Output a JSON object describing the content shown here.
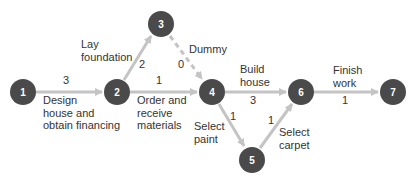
{
  "diagram": {
    "type": "activity-on-arrow network",
    "colors": {
      "node": "#4a4a4a",
      "node_text": "#ffffff",
      "arrow": "#c4c4c4",
      "text": "#333333"
    },
    "nodes": [
      {
        "id": "1",
        "label": "1"
      },
      {
        "id": "2",
        "label": "2"
      },
      {
        "id": "3",
        "label": "3"
      },
      {
        "id": "4",
        "label": "4"
      },
      {
        "id": "5",
        "label": "5"
      },
      {
        "id": "6",
        "label": "6"
      },
      {
        "id": "7",
        "label": "7"
      }
    ],
    "edges": [
      {
        "from": "1",
        "to": "2",
        "activity": "Design house and obtain financing",
        "duration": "3"
      },
      {
        "from": "2",
        "to": "3",
        "activity": "Lay foundation",
        "duration": "2"
      },
      {
        "from": "3",
        "to": "4",
        "activity": "Dummy",
        "duration": "0"
      },
      {
        "from": "2",
        "to": "4",
        "activity": "Order and receive materials",
        "duration": "1"
      },
      {
        "from": "4",
        "to": "6",
        "activity": "Build house",
        "duration": "3"
      },
      {
        "from": "4",
        "to": "5",
        "activity": "Select paint",
        "duration": "1"
      },
      {
        "from": "5",
        "to": "6",
        "activity": "Select carpet",
        "duration": "1"
      },
      {
        "from": "6",
        "to": "7",
        "activity": "Finish work",
        "duration": "1"
      }
    ],
    "labels": {
      "e12": [
        "Design",
        "house and",
        "obtain financing"
      ],
      "e23": [
        "Lay",
        "foundation"
      ],
      "e34": "Dummy",
      "e24": [
        "Order and",
        "receive",
        "materials"
      ],
      "e46": [
        "Build",
        "house"
      ],
      "e45": [
        "Select",
        "paint"
      ],
      "e56": [
        "Select",
        "carpet"
      ],
      "e67": [
        "Finish",
        "work"
      ]
    }
  }
}
